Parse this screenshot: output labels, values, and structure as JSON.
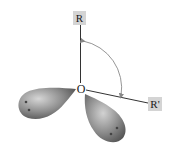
{
  "diagram": {
    "central_atom": {
      "label": "O"
    },
    "substituents": [
      {
        "id": "R",
        "label": "R"
      },
      {
        "id": "R-prime",
        "label": "R'"
      }
    ],
    "lone_pairs": [
      {
        "id": "left",
        "electrons": 2
      },
      {
        "id": "right",
        "electrons": 2
      }
    ],
    "angle_arc": {
      "between": [
        "R",
        "R'"
      ]
    },
    "colors": {
      "label_box": "#d4d4d4",
      "bond_line": "#333333",
      "arc": "#888888",
      "lobe_light": "#c8c8c8",
      "lobe_dark": "#555555",
      "electron_dot": "#444444"
    }
  }
}
